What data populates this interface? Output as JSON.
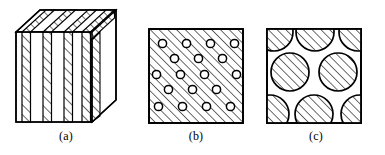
{
  "page": {
    "background_color": "#ffffff",
    "stroke_color": "#000000",
    "hatch_color": "#000000",
    "width": 385,
    "height": 155
  },
  "figures": [
    {
      "id": "a",
      "caption": "(a)",
      "name": "laminated-layered-composite-block",
      "type": "3d-block",
      "description": "Isometric block with alternating hatched and unhatched vertical lamellae",
      "layer_count": 6,
      "hatch_angle_deg": 45,
      "faces": [
        "front",
        "top",
        "right"
      ]
    },
    {
      "id": "b",
      "caption": "(b)",
      "name": "small-particle-dispersion-square",
      "type": "2d-square",
      "description": "Hatched matrix square containing small white circular inclusions in a staggered array",
      "hatch_angle_deg": 45,
      "circle_radius": 4.1,
      "circle_fill": "#ffffff",
      "rows": [
        {
          "count": 4,
          "cx": [
            14.5,
            38.5,
            62.5,
            86.5
          ],
          "cy": 15.5
        },
        {
          "count": 3,
          "cx": [
            26.5,
            50.5,
            74.5
          ],
          "cy": 30.5
        },
        {
          "count": 4,
          "cx": [
            8.5,
            32.5,
            56.5,
            88.5
          ],
          "cy": 46.5
        },
        {
          "count": 3,
          "cx": [
            20.5,
            44.5,
            68.5
          ],
          "cy": 61.5
        },
        {
          "count": 4,
          "cx": [
            10.5,
            34.5,
            58.5,
            82.5
          ],
          "cy": 78.5
        }
      ]
    },
    {
      "id": "c",
      "caption": "(c)",
      "name": "large-particle-dispersion-square",
      "type": "2d-square",
      "description": "White matrix square containing large hatched circles clipped by the square border",
      "hatch_angle_deg": 45,
      "circle_radius": 19,
      "circle_fill": "hatched",
      "rows": [
        {
          "count": 3,
          "cx": [
            8,
            49,
            92
          ],
          "cy": 4
        },
        {
          "count": 2,
          "cx": [
            24,
            72
          ],
          "cy": 44
        },
        {
          "count": 3,
          "cx": [
            4,
            48,
            94
          ],
          "cy": 86
        }
      ]
    }
  ]
}
